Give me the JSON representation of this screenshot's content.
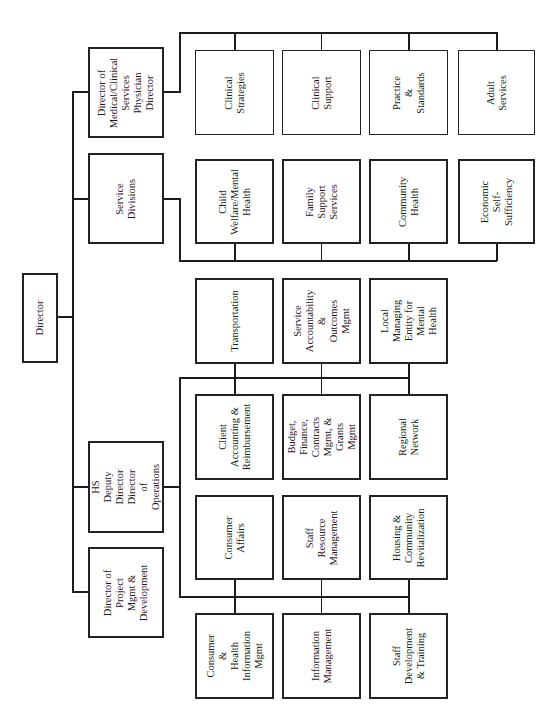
{
  "chart": {
    "orientation": "rotated-90-ccw",
    "root": {
      "label": "Director"
    },
    "level2": [
      {
        "id": "medical",
        "label": "Director of\nMedical/Clinical\nServices\nPhysician\nDirector"
      },
      {
        "id": "service",
        "label": "Service\nDivisions"
      },
      {
        "id": "deputy",
        "label": "HS Deputy\nDirector\nDirector of\nOperations"
      },
      {
        "id": "project",
        "label": "Director of\nProject\nMgmt &\nDevelopment"
      }
    ],
    "medical_units": [
      {
        "label": "Clinical\nStrategies"
      },
      {
        "label": "Clinical\nSupport"
      },
      {
        "label": "Practice &\nStandards"
      },
      {
        "label": "Adult Services"
      }
    ],
    "service_units": [
      {
        "label": "Child\nWelfare/Mental\nHealth"
      },
      {
        "label": "Family Support\nServices"
      },
      {
        "label": "Community\nHealth"
      },
      {
        "label": "Economic\nSelf-Sufficiency"
      }
    ],
    "ops_units_row1": [
      {
        "label": "Transportation"
      },
      {
        "label": "Service\nAccountability\n&\nOutcomes\nMgmt"
      },
      {
        "label": "Local\nManaging\nEntity for\nMental Health"
      }
    ],
    "ops_units_row2": [
      {
        "label": "Client\nAccounting &\nReimbursement"
      },
      {
        "label": "Budget,\nFinance,\nContracts\nMgmt, &\nGrants Mgmt"
      },
      {
        "label": "Regional\nNetwork"
      }
    ],
    "ops_units_row3": [
      {
        "label": "Consumer\nAffairs"
      },
      {
        "label": "Staff Resource\nManagement"
      },
      {
        "label": "Housing &\nCommunity\nRevitalization"
      }
    ],
    "ops_units_row4": [
      {
        "label": "Consumer &\nHealth\nInformation\nMgmt"
      },
      {
        "label": "Information\nManagement"
      },
      {
        "label": "Staff\nDevelopment\n& Training"
      }
    ]
  }
}
